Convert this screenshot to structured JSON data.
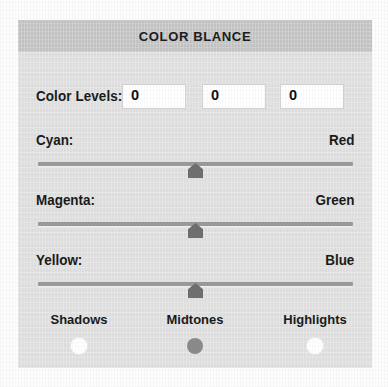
{
  "dialog": {
    "title": "COLOR BLANCE"
  },
  "color_levels": {
    "label": "Color Levels:",
    "values": [
      "0",
      "0",
      "0"
    ]
  },
  "sliders": [
    {
      "left_label": "Cyan:",
      "right_label": "Red",
      "value": 0,
      "min": -100,
      "max": 100
    },
    {
      "left_label": "Magenta:",
      "right_label": "Green",
      "value": 0,
      "min": -100,
      "max": 100
    },
    {
      "left_label": "Yellow:",
      "right_label": "Blue",
      "value": 0,
      "min": -100,
      "max": 100
    }
  ],
  "tone_options": [
    {
      "label": "Shadows",
      "selected": false
    },
    {
      "label": "Midtones",
      "selected": true
    },
    {
      "label": "Highlights",
      "selected": false
    }
  ],
  "colors": {
    "panel_background": "#e3e3e3",
    "titlebar_background": "#c9c9c9",
    "text": "#1a1a1a",
    "track": "#9a9a9a",
    "thumb": "#6f6f6f",
    "radio_unselected": "#ffffff",
    "radio_selected": "#8b8b8b",
    "input_background": "#ffffff"
  }
}
